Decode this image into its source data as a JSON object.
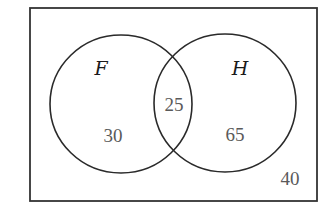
{
  "diagram": {
    "type": "venn",
    "universe": {
      "outside_count": "40"
    },
    "sets": [
      {
        "label": "F",
        "only_count": "30"
      },
      {
        "label": "H",
        "only_count": "65"
      }
    ],
    "intersection": {
      "sets": [
        "F",
        "H"
      ],
      "count": "25"
    },
    "colors": {
      "outline": "#2a2a2a",
      "count_text": "#5a5a5a",
      "label_text": "#1a1a1a",
      "background": "#ffffff"
    }
  }
}
